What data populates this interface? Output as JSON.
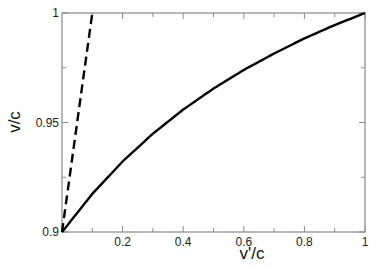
{
  "chart_data": {
    "type": "line",
    "title": "",
    "xlabel": "v'/c",
    "ylabel": "v/c",
    "xlim": [
      0,
      1
    ],
    "ylim": [
      0.9,
      1
    ],
    "grid": false,
    "legend": null,
    "x_ticks": [
      {
        "value": 0.2,
        "label": "0.2"
      },
      {
        "value": 0.4,
        "label": "0.4"
      },
      {
        "value": 0.6,
        "label": "0.6"
      },
      {
        "value": 0.8,
        "label": "0.8"
      },
      {
        "value": 1.0,
        "label": "1"
      }
    ],
    "x_minor_ticks": [
      0.1,
      0.3,
      0.5,
      0.7,
      0.9
    ],
    "y_ticks": [
      {
        "value": 0.9,
        "label": "0.9"
      },
      {
        "value": 0.95,
        "label": "0.95"
      },
      {
        "value": 1.0,
        "label": "1"
      }
    ],
    "y_minor_ticks": [
      0.925,
      0.975
    ],
    "series": [
      {
        "name": "relativistic",
        "style": "solid",
        "color": "#000000",
        "x": [
          0,
          0.1,
          0.2,
          0.3,
          0.4,
          0.5,
          0.6,
          0.7,
          0.8,
          0.9,
          1.0
        ],
        "values": [
          0.9,
          0.9174,
          0.9322,
          0.9449,
          0.9559,
          0.9655,
          0.974,
          0.9815,
          0.9884,
          0.9945,
          1.0
        ]
      },
      {
        "name": "classical",
        "style": "dashed",
        "color": "#000000",
        "x": [
          0,
          0.1
        ],
        "values": [
          0.9,
          1.0
        ]
      }
    ]
  },
  "colors": {
    "frame": "#8a8a8a",
    "curve": "#000000",
    "text": "#222222"
  }
}
